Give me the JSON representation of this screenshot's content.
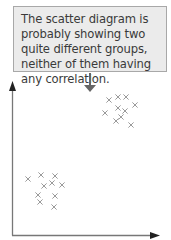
{
  "callout": {
    "text": "The scatter diagram is probably showing two quite different groups, neither of them having any correlation."
  },
  "colors": {
    "box_fill": "#ebebeb",
    "box_border": "#a8a8a8",
    "axis": "#777777",
    "marker": "#9a9a9a",
    "arrow": "#666666"
  },
  "chart_data": {
    "type": "scatter",
    "title": "",
    "xlabel": "",
    "ylabel": "",
    "grid": false,
    "marker": "x",
    "annotation": "The scatter diagram is probably showing two quite different groups, neither of them having any correlation.",
    "series": [
      {
        "name": "upper-right group",
        "points": [
          [
            109,
            100
          ],
          [
            118,
            97
          ],
          [
            126,
            97
          ],
          [
            135,
            105
          ],
          [
            118,
            108
          ],
          [
            125,
            111
          ],
          [
            105,
            113
          ],
          [
            121,
            117
          ],
          [
            116,
            121
          ],
          [
            131,
            125
          ]
        ]
      },
      {
        "name": "lower-left group",
        "points": [
          [
            28,
            179
          ],
          [
            41,
            175
          ],
          [
            55,
            176
          ],
          [
            52,
            183
          ],
          [
            44,
            186
          ],
          [
            62,
            185
          ],
          [
            38,
            195
          ],
          [
            55,
            196
          ],
          [
            40,
            202
          ],
          [
            54,
            207
          ]
        ]
      }
    ]
  }
}
